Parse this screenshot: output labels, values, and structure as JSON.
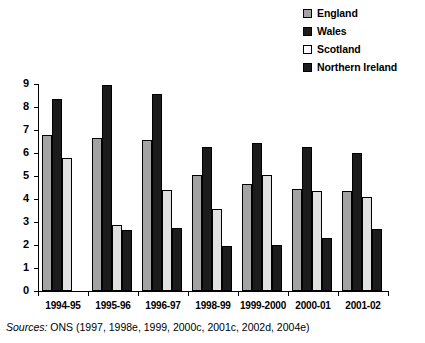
{
  "figure": {
    "cropped_title_fragment": "",
    "source_lead": "Sources:",
    "source_text": "ONS (1997, 1998e, 1999, 2000c, 2001c, 2002d, 2004e)"
  },
  "legend": {
    "items": [
      {
        "label": "England",
        "color": "#a3a3a3",
        "key": "england"
      },
      {
        "label": "Wales",
        "color": "#1c1c1c",
        "key": "wales"
      },
      {
        "label": "Scotland",
        "color": "#ffffff",
        "key": "scotland"
      },
      {
        "label": "Northern Ireland",
        "color": "#1c1c1c",
        "key": "ni"
      }
    ]
  },
  "axis": {
    "y_ticks": [
      "0",
      "1",
      "2",
      "3",
      "4",
      "5",
      "6",
      "7",
      "8",
      "9"
    ]
  },
  "chart_data": {
    "type": "bar",
    "title": "",
    "xlabel": "",
    "ylabel": "",
    "ylim": [
      0,
      9
    ],
    "yticks": [
      0,
      1,
      2,
      3,
      4,
      5,
      6,
      7,
      8,
      9
    ],
    "grid": false,
    "legend_position": "top-right",
    "categories": [
      "1994-95",
      "1995-96",
      "1996-97",
      "1998-99",
      "1999-2000",
      "2000-01",
      "2001-02"
    ],
    "series": [
      {
        "name": "England",
        "color": "#a3a3a3",
        "values": [
          6.8,
          6.65,
          6.55,
          5.05,
          4.65,
          4.45,
          4.35
        ]
      },
      {
        "name": "Wales",
        "color": "#1c1c1c",
        "values": [
          8.35,
          8.95,
          8.55,
          6.25,
          6.45,
          6.25,
          6.0
        ]
      },
      {
        "name": "Scotland",
        "color": "#e0e0e0",
        "values": [
          5.8,
          2.85,
          4.4,
          3.55,
          5.05,
          4.35,
          4.1
        ]
      },
      {
        "name": "Northern Ireland",
        "color": "#1c1c1c",
        "values": [
          null,
          2.65,
          2.75,
          1.95,
          2.0,
          2.3,
          2.7
        ]
      }
    ]
  }
}
